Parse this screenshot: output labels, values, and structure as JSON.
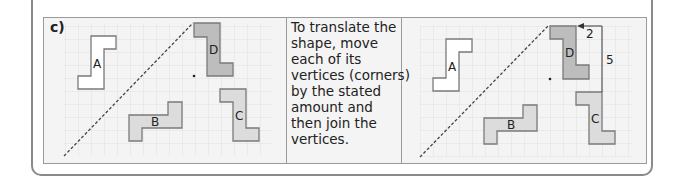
{
  "question": {
    "label": "c)",
    "instruction_lines": [
      "To translate the",
      "shape, move",
      "each of its",
      "vertices (corners)",
      "by the stated",
      "amount and",
      "then join the",
      "vertices."
    ]
  },
  "left_grid": {
    "shapes": [
      {
        "name": "A",
        "fill": "#ffffff"
      },
      {
        "name": "B",
        "fill": "#dcdcdc"
      },
      {
        "name": "C",
        "fill": "#dcdcdc"
      },
      {
        "name": "D",
        "fill": "#bdbdbd"
      }
    ]
  },
  "right_grid": {
    "shapes": [
      {
        "name": "A",
        "fill": "#ffffff"
      },
      {
        "name": "B",
        "fill": "#dcdcdc"
      },
      {
        "name": "C",
        "fill": "#dcdcdc"
      },
      {
        "name": "D",
        "fill": "#bdbdbd"
      }
    ],
    "annotations": {
      "horizontal_move": "2",
      "vertical_move": "5"
    }
  },
  "colors": {
    "grid_line": "#dedede",
    "outline": "#7a7a7a",
    "background": "#f4f4f4"
  }
}
